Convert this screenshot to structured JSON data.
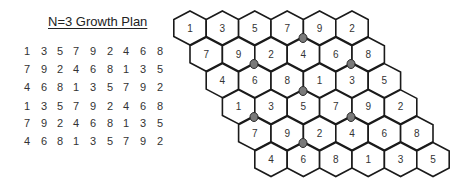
{
  "title": "N=3 Growth Plan",
  "grid": {
    "rows": [
      [
        "1",
        "3",
        "5",
        "7",
        "9",
        "2",
        "4",
        "6",
        "8"
      ],
      [
        "7",
        "9",
        "2",
        "4",
        "6",
        "8",
        "1",
        "3",
        "5"
      ],
      [
        "4",
        "6",
        "8",
        "1",
        "3",
        "5",
        "7",
        "9",
        "2"
      ],
      [
        "1",
        "3",
        "5",
        "7",
        "9",
        "2",
        "4",
        "6",
        "8"
      ],
      [
        "7",
        "9",
        "2",
        "4",
        "6",
        "8",
        "1",
        "3",
        "5"
      ],
      [
        "4",
        "6",
        "8",
        "1",
        "3",
        "5",
        "7",
        "9",
        "2"
      ]
    ]
  },
  "hexmap": {
    "rows": [
      [
        "1",
        "3",
        "5",
        "7",
        "9",
        "2"
      ],
      [
        "7",
        "9",
        "2",
        "4",
        "6",
        "8"
      ],
      [
        "4",
        "6",
        "8",
        "1",
        "3",
        "5"
      ],
      [
        "1",
        "3",
        "5",
        "7",
        "9",
        "2"
      ],
      [
        "7",
        "9",
        "2",
        "4",
        "6",
        "8"
      ],
      [
        "4",
        "6",
        "8",
        "1",
        "3",
        "5"
      ]
    ],
    "marker_color": "#7a7a7a"
  }
}
